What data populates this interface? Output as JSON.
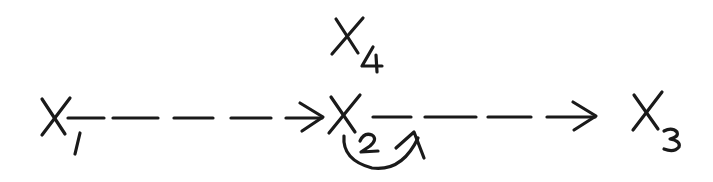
{
  "diagram": {
    "type": "directed-graph",
    "style": "hand-drawn",
    "colors": {
      "ink": "#1a1a1a",
      "background": "#ffffff"
    },
    "nodes": [
      {
        "id": "x1",
        "label": "X",
        "subscript": "1",
        "full": "X1"
      },
      {
        "id": "x2",
        "label": "X",
        "subscript": "2",
        "full": "X2"
      },
      {
        "id": "x3",
        "label": "X",
        "subscript": "3",
        "full": "X3"
      },
      {
        "id": "x4",
        "label": "X",
        "subscript": "4",
        "full": "X4"
      }
    ],
    "edges": [
      {
        "from": "X1",
        "to": "X2",
        "style": "dashed",
        "directed": true
      },
      {
        "from": "X2",
        "to": "X3",
        "style": "dashed",
        "directed": true
      },
      {
        "from": "X2",
        "to": "X2",
        "style": "solid",
        "directed": true,
        "kind": "self-loop"
      }
    ]
  }
}
